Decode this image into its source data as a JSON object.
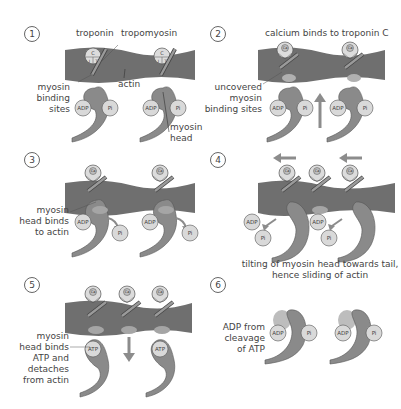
{
  "colors": {
    "actin": "#6f6f6f",
    "myosin": "#8a8a8a",
    "molecule": "#d9d9d9",
    "binding_site": "#b0b0b0",
    "arrow": "#8c8c8c",
    "text": "#444444"
  },
  "panels": [
    {
      "step": "1",
      "labels": {
        "troponin": "troponin",
        "tropomyosin": "tropomyosin",
        "actin": "actin",
        "binding_sites": [
          "myosin",
          "binding",
          "sites"
        ],
        "myosin_head": [
          "myosin",
          "head"
        ]
      },
      "molecules": [
        "ADP",
        "Pi",
        "ADP",
        "Pi"
      ],
      "troponin_subunits": [
        "C",
        "I",
        "T"
      ]
    },
    {
      "step": "2",
      "labels": {
        "title": "calcium binds to troponin C",
        "uncovered": [
          "uncovered",
          "myosin",
          "binding sites"
        ]
      },
      "molecules": [
        "ADP",
        "Pi",
        "ADP",
        "Pi"
      ],
      "ion": "Ca²⁺"
    },
    {
      "step": "3",
      "labels": {
        "binds": [
          "myosin",
          "head binds",
          "to actin"
        ]
      },
      "molecules": [
        "ADP",
        "Pi",
        "ADP",
        "Pi"
      ]
    },
    {
      "step": "4",
      "labels": {
        "caption": [
          "tilting of myosin head towards tail,",
          "hence sliding of actin"
        ]
      },
      "molecules": [
        "ADP",
        "Pi",
        "ADP",
        "Pi"
      ]
    },
    {
      "step": "5",
      "labels": {
        "detach": [
          "myosin",
          "head binds",
          "ATP and",
          "detaches",
          "from actin"
        ]
      },
      "molecules": [
        "ATP",
        "ATP"
      ]
    },
    {
      "step": "6",
      "labels": {
        "cleavage": [
          "ADP from",
          "cleavage",
          "of ATP"
        ]
      },
      "molecules": [
        "ADP",
        "Pi",
        "ADP",
        "Pi"
      ]
    }
  ]
}
